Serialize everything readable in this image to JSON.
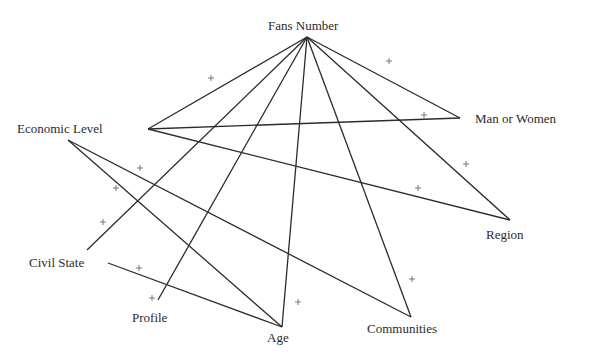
{
  "diagram": {
    "type": "network-graph",
    "nodes": [
      {
        "id": "fans_number",
        "label": "Fans Number",
        "vertex": [
          307,
          37
        ],
        "label_pos": [
          268,
          19
        ]
      },
      {
        "id": "economic_level",
        "label": "Economic Level",
        "vertex": [
          148,
          129
        ],
        "label_pos": [
          17,
          122
        ]
      },
      {
        "id": "man_or_women",
        "label": "Man or Women",
        "vertex": [
          460,
          118
        ],
        "label_pos": [
          475,
          112
        ]
      },
      {
        "id": "region",
        "label": "Region",
        "vertex": [
          510,
          220
        ],
        "label_pos": [
          486,
          228
        ]
      },
      {
        "id": "civil_state",
        "label": "Civil State",
        "vertex": [
          108,
          263
        ],
        "label_pos": [
          29,
          256
        ]
      },
      {
        "id": "profile",
        "label": "Profile",
        "vertex": [
          158,
          300
        ],
        "label_pos": [
          132,
          311
        ]
      },
      {
        "id": "age",
        "label": "Age",
        "vertex": [
          282,
          327
        ],
        "label_pos": [
          267,
          331
        ]
      },
      {
        "id": "communities",
        "label": "Communities",
        "vertex": [
          411,
          317
        ],
        "label_pos": [
          367,
          322
        ]
      }
    ],
    "edges": [
      {
        "from": "fans_number",
        "to": "economic_level",
        "coords": [
          307,
          37,
          148,
          129
        ]
      },
      {
        "from": "fans_number",
        "to": "civil_state",
        "coords": [
          307,
          37,
          87,
          250
        ]
      },
      {
        "from": "fans_number",
        "to": "profile",
        "coords": [
          307,
          37,
          158,
          300
        ]
      },
      {
        "from": "fans_number",
        "to": "age",
        "coords": [
          307,
          37,
          282,
          327
        ]
      },
      {
        "from": "fans_number",
        "to": "communities",
        "coords": [
          307,
          37,
          411,
          317
        ]
      },
      {
        "from": "fans_number",
        "to": "region",
        "coords": [
          307,
          37,
          510,
          220
        ]
      },
      {
        "from": "fans_number",
        "to": "man_or_women",
        "coords": [
          307,
          37,
          460,
          118
        ]
      },
      {
        "from": "economic_level",
        "to": "man_or_women",
        "coords": [
          148,
          129,
          460,
          118
        ]
      },
      {
        "from": "economic_level",
        "to": "region",
        "coords": [
          148,
          129,
          510,
          220
        ]
      },
      {
        "from": "economic_level",
        "to": "age",
        "coords": [
          68,
          140,
          282,
          327
        ]
      },
      {
        "from": "economic_level",
        "to": "communities",
        "coords": [
          68,
          140,
          411,
          317
        ]
      },
      {
        "from": "civil_state",
        "to": "age",
        "coords": [
          108,
          263,
          282,
          327
        ]
      }
    ],
    "plus_signs": [
      [
        211,
        78
      ],
      [
        389,
        61
      ],
      [
        424,
        115
      ],
      [
        466,
        164
      ],
      [
        418,
        188
      ],
      [
        140,
        168
      ],
      [
        116,
        188
      ],
      [
        103,
        222
      ],
      [
        139,
        268
      ],
      [
        152,
        298
      ],
      [
        298,
        302
      ],
      [
        412,
        279
      ]
    ],
    "line_color": "#2b2b2b",
    "plus_color": "#6a6a6a"
  }
}
